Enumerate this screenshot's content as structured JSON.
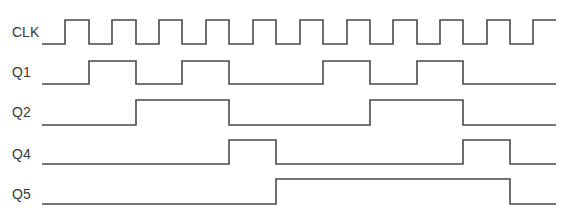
{
  "diagram": {
    "type": "timing-diagram",
    "line_color": "#4a4a4a",
    "label_color": "#3a3a3a",
    "x_start": 42,
    "x_end": 556,
    "signals": [
      {
        "name": "CLK",
        "label_y": 37,
        "high_y": 20,
        "low_y": 44,
        "initial": 0,
        "edges": [
          65,
          89,
          112,
          136,
          159,
          182,
          206,
          229,
          253,
          276,
          300,
          323,
          347,
          370,
          393,
          417,
          440,
          463,
          487,
          510,
          533
        ]
      },
      {
        "name": "Q1",
        "label_y": 77,
        "high_y": 61,
        "low_y": 84,
        "initial": 0,
        "edges": [
          89,
          136,
          182,
          229,
          323,
          370,
          417,
          463
        ]
      },
      {
        "name": "Q2",
        "label_y": 117,
        "high_y": 100,
        "low_y": 125,
        "initial": 0,
        "edges": [
          136,
          229,
          370,
          463
        ]
      },
      {
        "name": "Q4",
        "label_y": 159,
        "high_y": 140,
        "low_y": 164,
        "initial": 0,
        "edges": [
          229,
          276,
          463,
          510
        ]
      },
      {
        "name": "Q5",
        "label_y": 199,
        "high_y": 179,
        "low_y": 204,
        "initial": 0,
        "edges": [
          276,
          510
        ]
      }
    ]
  }
}
